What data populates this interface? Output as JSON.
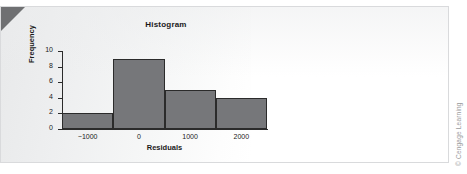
{
  "figure": {
    "corner_fold_color": "#6f7072",
    "card_border_color": "#d9dadc"
  },
  "credit": {
    "text": "© Cengage Learning",
    "color": "#9a9b9d"
  },
  "chart_data": {
    "type": "bar",
    "title": "Histogram",
    "xlabel": "Residuals",
    "ylabel": "Frequency",
    "categories": [
      "-1000",
      "0",
      "1000",
      "2000"
    ],
    "values": [
      2,
      9,
      5,
      4
    ],
    "bin_centers": [
      -1000,
      0,
      1000,
      2000
    ],
    "bin_width": 1000,
    "bin_edges": [
      -1500,
      -500,
      500,
      1500,
      2500
    ],
    "xtick_labels": [
      "−1000",
      "0",
      "1000",
      "2000"
    ],
    "xtick_values": [
      -1000,
      0,
      1000,
      2000
    ],
    "ytick_labels": [
      "0",
      "2",
      "4",
      "6",
      "8",
      "10"
    ],
    "ytick_values": [
      0,
      2,
      4,
      6,
      8,
      10
    ],
    "ylim": [
      0,
      10
    ],
    "xlim": [
      -1500,
      2500
    ],
    "grid": false,
    "legend": false,
    "bar_fill_color": "#76777a",
    "bar_edge_color": "#2b2b2b",
    "axis_color": "#2b2b2b"
  }
}
